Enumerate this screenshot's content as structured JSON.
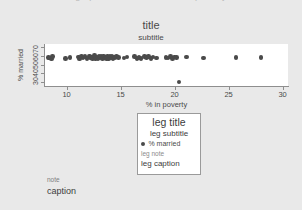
{
  "window": {
    "clipped_heading": "graph — % married vs % in poverty"
  },
  "titles": {
    "title": "title",
    "subtitle": "subtitle",
    "note": "note",
    "caption": "caption"
  },
  "legend": {
    "title": "leg title",
    "subtitle": "leg subtitle",
    "key_label": "% married",
    "note": "leg note",
    "caption": "leg caption",
    "marker_icon": "filled-circle-icon",
    "marker_color": "#4a4a4a"
  },
  "chart_data": {
    "type": "scatter",
    "title": "title",
    "subtitle": "subtitle",
    "xlabel": "% in poverty",
    "ylabel": "% married",
    "xlim": [
      8,
      30.5
    ],
    "ylim": [
      26,
      73
    ],
    "xticks": [
      10,
      15,
      20,
      25,
      30
    ],
    "yticks": [
      30,
      40,
      50,
      60,
      70
    ],
    "xticklabels": [
      "10",
      "15",
      "20",
      "25",
      "30"
    ],
    "yticklabels": [
      "30",
      "40",
      "50",
      "60",
      "70"
    ],
    "grid": false,
    "legend_position": "below-plot-center",
    "marker_color": "#4a4a4a",
    "series": [
      {
        "name": "% married",
        "points": [
          [
            8.3,
            58.1
          ],
          [
            8.4,
            57.4
          ],
          [
            8.6,
            56.2
          ],
          [
            8.7,
            59.0
          ],
          [
            9.9,
            56.8
          ],
          [
            10.3,
            57.9
          ],
          [
            11.1,
            58.4
          ],
          [
            11.2,
            56.0
          ],
          [
            11.4,
            59.3
          ],
          [
            11.5,
            57.2
          ],
          [
            11.7,
            58.8
          ],
          [
            11.9,
            56.5
          ],
          [
            12.1,
            59.5
          ],
          [
            12.2,
            57.6
          ],
          [
            12.3,
            58.2
          ],
          [
            12.4,
            56.9
          ],
          [
            12.6,
            59.8
          ],
          [
            12.7,
            57.1
          ],
          [
            12.8,
            58.6
          ],
          [
            12.9,
            56.3
          ],
          [
            13.0,
            59.1
          ],
          [
            13.1,
            57.8
          ],
          [
            13.2,
            58.9
          ],
          [
            13.3,
            56.7
          ],
          [
            13.4,
            59.6
          ],
          [
            13.5,
            57.3
          ],
          [
            13.6,
            58.5
          ],
          [
            13.7,
            57.0
          ],
          [
            13.8,
            59.2
          ],
          [
            13.9,
            56.4
          ],
          [
            14.0,
            58.7
          ],
          [
            14.1,
            57.5
          ],
          [
            14.2,
            59.4
          ],
          [
            14.3,
            56.6
          ],
          [
            14.4,
            58.3
          ],
          [
            14.5,
            57.7
          ],
          [
            14.6,
            59.0
          ],
          [
            14.8,
            58.0
          ],
          [
            15.3,
            57.4
          ],
          [
            15.6,
            58.6
          ],
          [
            16.3,
            59.3
          ],
          [
            16.5,
            57.0
          ],
          [
            16.7,
            58.1
          ],
          [
            16.9,
            56.8
          ],
          [
            17.2,
            58.9
          ],
          [
            17.4,
            57.6
          ],
          [
            17.6,
            59.1
          ],
          [
            17.8,
            56.9
          ],
          [
            18.0,
            58.4
          ],
          [
            18.3,
            57.2
          ],
          [
            19.2,
            58.0
          ],
          [
            19.4,
            57.5
          ],
          [
            19.6,
            58.8
          ],
          [
            19.8,
            57.1
          ],
          [
            20.0,
            58.3
          ],
          [
            20.2,
            57.9
          ],
          [
            20.4,
            30.5
          ],
          [
            21.1,
            58.5
          ],
          [
            22.7,
            57.3
          ],
          [
            25.7,
            57.8
          ],
          [
            28.0,
            57.6
          ]
        ]
      }
    ]
  },
  "axes": {
    "y_tick_labels": [
      "70",
      "60",
      "50",
      "40",
      "30"
    ],
    "x_tick_labels": [
      "10",
      "15",
      "20",
      "25",
      "30"
    ]
  }
}
